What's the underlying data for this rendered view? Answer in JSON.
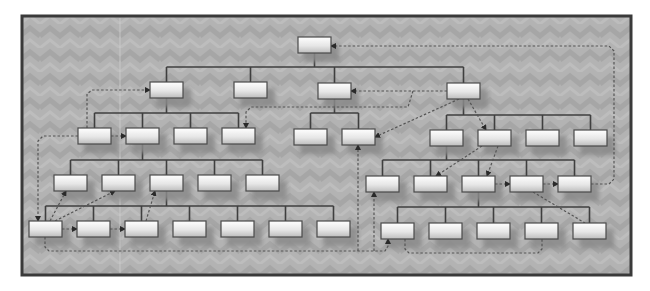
{
  "diagram": {
    "title": "",
    "type": "org-chart-hierarchy",
    "colors": {
      "page_background": "#ffffff",
      "panel_background": "#b3b3b3",
      "panel_pattern": "#a7a7a7",
      "frame_border": "#3a3a3a",
      "box_fill_top": "#ffffff",
      "box_fill_bottom": "#c8c8c8",
      "box_border": "#4a4a4a",
      "box_shadow": "#8a8a8a",
      "tree_line": "#3f3f3f",
      "dashed_link": "#555555"
    },
    "frame": {
      "x": 22,
      "y": 16,
      "w": 609,
      "h": 259
    },
    "box_size": {
      "w": 33,
      "h": 16
    },
    "nodes": [
      {
        "id": "root",
        "x": 298,
        "y": 37,
        "label": ""
      },
      {
        "id": "L1-1",
        "x": 150,
        "y": 82,
        "label": ""
      },
      {
        "id": "L1-2",
        "x": 234,
        "y": 82,
        "label": ""
      },
      {
        "id": "L1-3",
        "x": 318,
        "y": 83,
        "label": ""
      },
      {
        "id": "L1-4",
        "x": 447,
        "y": 83,
        "label": ""
      },
      {
        "id": "A2-1",
        "x": 78,
        "y": 128,
        "label": ""
      },
      {
        "id": "A2-2",
        "x": 126,
        "y": 128,
        "label": ""
      },
      {
        "id": "A2-3",
        "x": 174,
        "y": 128,
        "label": ""
      },
      {
        "id": "A2-4",
        "x": 222,
        "y": 128,
        "label": ""
      },
      {
        "id": "C2-1",
        "x": 294,
        "y": 129,
        "label": ""
      },
      {
        "id": "C2-2",
        "x": 342,
        "y": 129,
        "label": ""
      },
      {
        "id": "D2-1",
        "x": 430,
        "y": 130,
        "label": ""
      },
      {
        "id": "D2-2",
        "x": 478,
        "y": 130,
        "label": ""
      },
      {
        "id": "D2-3",
        "x": 526,
        "y": 130,
        "label": ""
      },
      {
        "id": "D2-4",
        "x": 574,
        "y": 130,
        "label": ""
      },
      {
        "id": "A3-1",
        "x": 54,
        "y": 175,
        "label": ""
      },
      {
        "id": "A3-2",
        "x": 102,
        "y": 175,
        "label": ""
      },
      {
        "id": "A3-3",
        "x": 150,
        "y": 175,
        "label": ""
      },
      {
        "id": "A3-4",
        "x": 198,
        "y": 175,
        "label": ""
      },
      {
        "id": "A3-5",
        "x": 246,
        "y": 175,
        "label": ""
      },
      {
        "id": "D3-1",
        "x": 366,
        "y": 176,
        "label": ""
      },
      {
        "id": "D3-2",
        "x": 414,
        "y": 176,
        "label": ""
      },
      {
        "id": "D3-3",
        "x": 462,
        "y": 176,
        "label": ""
      },
      {
        "id": "D3-4",
        "x": 510,
        "y": 176,
        "label": ""
      },
      {
        "id": "D3-5",
        "x": 558,
        "y": 176,
        "label": ""
      },
      {
        "id": "A4-1",
        "x": 29,
        "y": 221,
        "label": ""
      },
      {
        "id": "A4-2",
        "x": 77,
        "y": 221,
        "label": ""
      },
      {
        "id": "A4-3",
        "x": 125,
        "y": 221,
        "label": ""
      },
      {
        "id": "A4-4",
        "x": 173,
        "y": 221,
        "label": ""
      },
      {
        "id": "A4-5",
        "x": 221,
        "y": 221,
        "label": ""
      },
      {
        "id": "A4-6",
        "x": 269,
        "y": 221,
        "label": ""
      },
      {
        "id": "A4-7",
        "x": 317,
        "y": 221,
        "label": ""
      },
      {
        "id": "D4-1",
        "x": 381,
        "y": 223,
        "label": ""
      },
      {
        "id": "D4-2",
        "x": 429,
        "y": 223,
        "label": ""
      },
      {
        "id": "D4-3",
        "x": 477,
        "y": 223,
        "label": ""
      },
      {
        "id": "D4-4",
        "x": 525,
        "y": 223,
        "label": ""
      },
      {
        "id": "D4-5",
        "x": 573,
        "y": 223,
        "label": ""
      }
    ],
    "tree_edges": [
      {
        "parent": "root",
        "children": [
          "L1-1",
          "L1-2",
          "L1-3",
          "L1-4"
        ],
        "bus_y": 67
      },
      {
        "parent": "L1-1",
        "children": [
          "A2-1",
          "A2-2",
          "A2-3",
          "A2-4"
        ],
        "bus_y": 113
      },
      {
        "parent": "L1-3",
        "children": [
          "C2-1",
          "C2-2"
        ],
        "bus_y": 113
      },
      {
        "parent": "L1-4",
        "children": [
          "D2-1",
          "D2-2",
          "D2-3",
          "D2-4"
        ],
        "bus_y": 115
      },
      {
        "parent": "A2-2",
        "children": [
          "A3-1",
          "A3-2",
          "A3-3",
          "A3-4",
          "A3-5"
        ],
        "bus_y": 160
      },
      {
        "parent": "D2-1",
        "children": [
          "D3-1",
          "D3-2",
          "D3-3",
          "D3-4",
          "D3-5"
        ],
        "bus_y": 160
      },
      {
        "parent": "A3-3",
        "children": [
          "A4-1",
          "A4-2",
          "A4-3",
          "A4-4",
          "A4-5",
          "A4-6",
          "A4-7"
        ],
        "bus_y": 206
      },
      {
        "parent": "D3-3",
        "children": [
          "D4-1",
          "D4-2",
          "D4-3",
          "D4-4",
          "D4-5"
        ],
        "bus_y": 207
      }
    ],
    "dashed_links": [
      {
        "name": "A2-1-to-L1-1",
        "points": "[[87,128],[87,94],[92,90],[150,90]]",
        "arrow": "end"
      },
      {
        "name": "D3-5-to-root",
        "points": "[[591,184],[609,184],[614,179],[614,51],[609,46],[331,46]]",
        "arrow": "end"
      },
      {
        "name": "L1-4-to-L1-3",
        "points": "[[447,91],[351,91]]",
        "arrow": "end"
      },
      {
        "name": "L1-4-to-A2-4",
        "points": "[[413,91],[408,107],[251,107],[246,112],[246,128]]",
        "arrow": "end"
      },
      {
        "name": "L1-4-to-C2-2",
        "points": "[[459,99],[375,137]]",
        "arrow": "end"
      },
      {
        "name": "L1-4-to-D2-2",
        "points": "[[468,99],[486,130]]",
        "arrow": "end"
      },
      {
        "name": "A2-1-to-A4-1",
        "points": "[[78,136],[43,136],[38,141],[38,221]]",
        "arrow": "end"
      },
      {
        "name": "A2-1-to-A2-2",
        "points": "[[111,136],[126,136]]",
        "arrow": "end"
      },
      {
        "name": "A4-1-to-A3-1",
        "points": "[[50,221],[66,191]]",
        "arrow": "end"
      },
      {
        "name": "A4-1-to-A3-2",
        "points": "[[55,221],[115,191]]",
        "arrow": "end"
      },
      {
        "name": "A4-3-to-A3-3",
        "points": "[[146,221],[155,191]]",
        "arrow": "end"
      },
      {
        "name": "A4-1-to-A4-2",
        "points": "[[62,229],[77,229]]",
        "arrow": "end"
      },
      {
        "name": "A4-2-to-A4-3",
        "points": "[[110,229],[125,229]]",
        "arrow": "end"
      },
      {
        "name": "A4-1-bottom-loop",
        "points": "[[45,237],[45,247],[49,251],[385,251],[388,246],[388,239]]",
        "arrow": "end"
      },
      {
        "name": "loop-to-C2-2",
        "points": "[[358,251],[358,145]]",
        "arrow": "end"
      },
      {
        "name": "loop-to-D3-1",
        "points": "[[374,251],[374,192]]",
        "arrow": "end"
      },
      {
        "name": "D4-1-to-D4-4",
        "points": "[[405,239],[405,249],[409,253],[538,253],[542,249],[542,239]]",
        "arrow": "none"
      },
      {
        "name": "D2-2-to-D3-2",
        "points": "[[482,146],[436,176]]",
        "arrow": "end"
      },
      {
        "name": "D2-2-to-D3-3",
        "points": "[[498,146],[487,176]]",
        "arrow": "end"
      },
      {
        "name": "D3-3-to-D3-4",
        "points": "[[495,184],[510,184]]",
        "arrow": "end"
      },
      {
        "name": "D3-4-to-D3-5",
        "points": "[[543,184],[558,184]]",
        "arrow": "end"
      },
      {
        "name": "D3-4-to-D4-5",
        "points": "[[533,192],[585,223]]",
        "arrow": "none"
      }
    ]
  }
}
